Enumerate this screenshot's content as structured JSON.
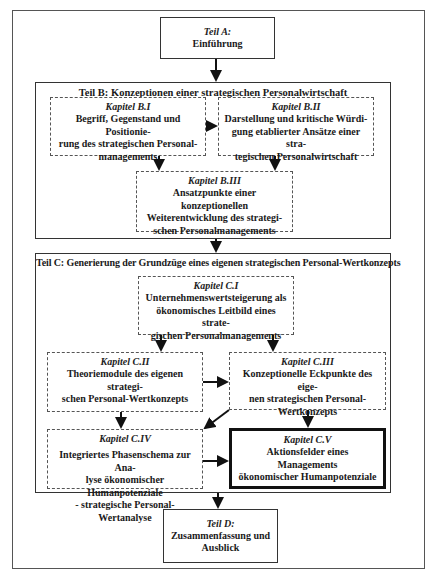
{
  "diagram": {
    "teil_a": {
      "label": "Teil A:",
      "title": "Einführung"
    },
    "teil_b": {
      "title": "Teil B: Konzeptionen einer strategischen Personalwirtschaft",
      "kapitel": [
        {
          "label": "Kapitel B.I",
          "lines": [
            "Begriff, Gegenstand und Positionie-",
            "rung des strategischen Personal-",
            "managements"
          ]
        },
        {
          "label": "Kapitel B.II",
          "lines": [
            "Darstellung und kritische Würdi-",
            "gung etablierter Ansätze einer stra-",
            "tegischen Personalwirtschaft"
          ]
        },
        {
          "label": "Kapitel B.III",
          "lines": [
            "Ansatzpunkte einer konzeptionellen",
            "Weiterentwicklung des strategi-",
            "schen Personalmanagements"
          ]
        }
      ]
    },
    "teil_c": {
      "title": "Teil C: Generierung der Grundzüge eines eigenen strategischen Personal-Wertkonzepts",
      "kapitel": [
        {
          "label": "Kapitel C.I",
          "lines": [
            "Unternehmenswertsteigerung als",
            "ökonomisches Leitbild eines strate-",
            "gischen Personalmanagements"
          ]
        },
        {
          "label": "Kapitel C.II",
          "lines": [
            "Theoriemodule des eigenen strategi-",
            "schen Personal-Wertkonzepts"
          ]
        },
        {
          "label": "Kapitel C.III",
          "lines": [
            "Konzeptionelle Eckpunkte des eige-",
            "nen strategischen Personal-",
            "Wertkonzepts"
          ]
        },
        {
          "label": "Kapitel C.IV",
          "lines": [
            "Integriertes Phasenschema zur Ana-",
            "lyse ökonomischer Humanpotenziale",
            "- strategische Personal-Wertanalyse"
          ]
        },
        {
          "label": "Kapitel C.V",
          "lines": [
            "Aktionsfelder eines Managements",
            "ökonomischer Humanpotenziale"
          ]
        }
      ]
    },
    "teil_d": {
      "label": "Teil D:",
      "lines": [
        "Zusammenfassung und",
        "Ausblick"
      ]
    },
    "colors": {
      "line": "#111111",
      "frame": "#555555",
      "background": "#ffffff"
    }
  }
}
